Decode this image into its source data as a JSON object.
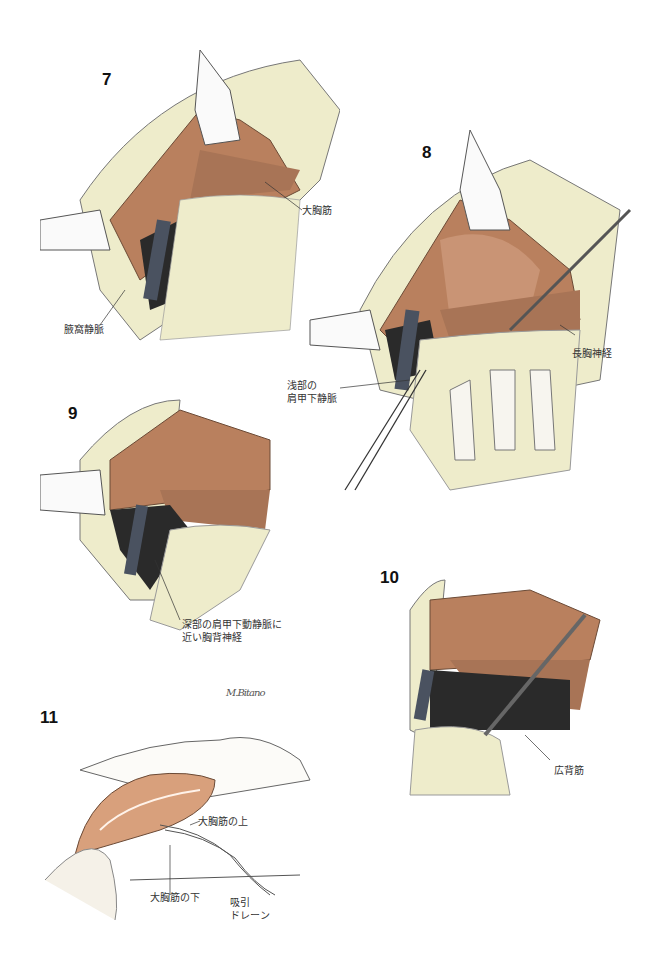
{
  "figures": [
    {
      "number": "7",
      "labels": {
        "muscle": "大胸筋",
        "vein": "腋窩静脈"
      }
    },
    {
      "number": "8",
      "labels": {
        "vein": "浅部の",
        "vein2": "肩甲下静脈",
        "nerve": "長胸神経"
      }
    },
    {
      "number": "9",
      "labels": {
        "nerve1": "深部の肩甲下動静脈に",
        "nerve2": "近い胸背神経"
      }
    },
    {
      "number": "10",
      "labels": {
        "muscle": "広背筋"
      }
    },
    {
      "number": "11",
      "labels": {
        "above": "大胸筋の上",
        "below": "大胸筋の下",
        "drain1": "吸引",
        "drain2": "ドレーン"
      }
    }
  ],
  "signature": "M.Bitano",
  "colors": {
    "muscle": "#b9805e",
    "fat": "#eeeccb",
    "vein": "#4a5260",
    "dark": "#2a2a2a",
    "skin": "#f4f1ec"
  }
}
